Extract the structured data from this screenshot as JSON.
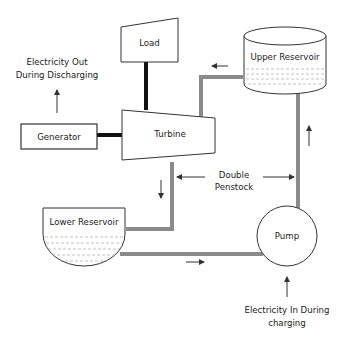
{
  "diagram": {
    "nodes": {
      "load": "Load",
      "turbine": "Turbine",
      "generator": "Generator",
      "upper_reservoir": "Upper Reservoir",
      "lower_reservoir": "Lower Reservoir",
      "pump": "Pump"
    },
    "annotations": {
      "electricity_out_line1": "Electricity Out",
      "electricity_out_line2": "During Discharging",
      "electricity_in_line1": "Electricity In During",
      "electricity_in_line2": "charging",
      "penstock_line1": "Double",
      "penstock_line2": "Penstock"
    },
    "colors": {
      "pipe": "#8a8a8a",
      "shaft": "#111111",
      "outline": "#333333",
      "water_dash": "#aaaaaa"
    }
  }
}
